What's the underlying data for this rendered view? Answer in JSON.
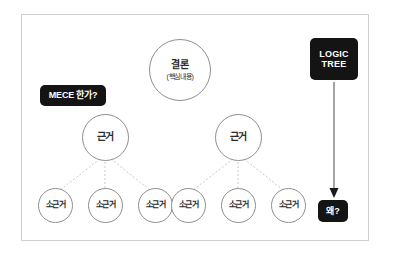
{
  "diagram": {
    "title": "LOGIC TREE",
    "frame": {
      "border_color": "#cfcfcf",
      "background": "#ffffff"
    },
    "node_stroke_color": "#8e8e8e",
    "badge_color": "#141414",
    "badge_text_color": "#ffffff",
    "connector_color": "#c9c9c9",
    "arrow_color": "#8c8c8c"
  },
  "nodes": {
    "conclusion": {
      "label": "결론",
      "sublabel": "(핵심내용)"
    },
    "reasons": [
      {
        "label": "근거"
      },
      {
        "label": "근거"
      }
    ],
    "sub_reasons": [
      {
        "label": "소근거"
      },
      {
        "label": "소근거"
      },
      {
        "label": "소근거"
      },
      {
        "label": "소근거"
      },
      {
        "label": "소근거"
      },
      {
        "label": "소근거"
      }
    ]
  },
  "badges": {
    "mece": "MECE 한가?",
    "logic_tree_line1": "LOGIC",
    "logic_tree_line2": "TREE",
    "why": "왜?"
  }
}
